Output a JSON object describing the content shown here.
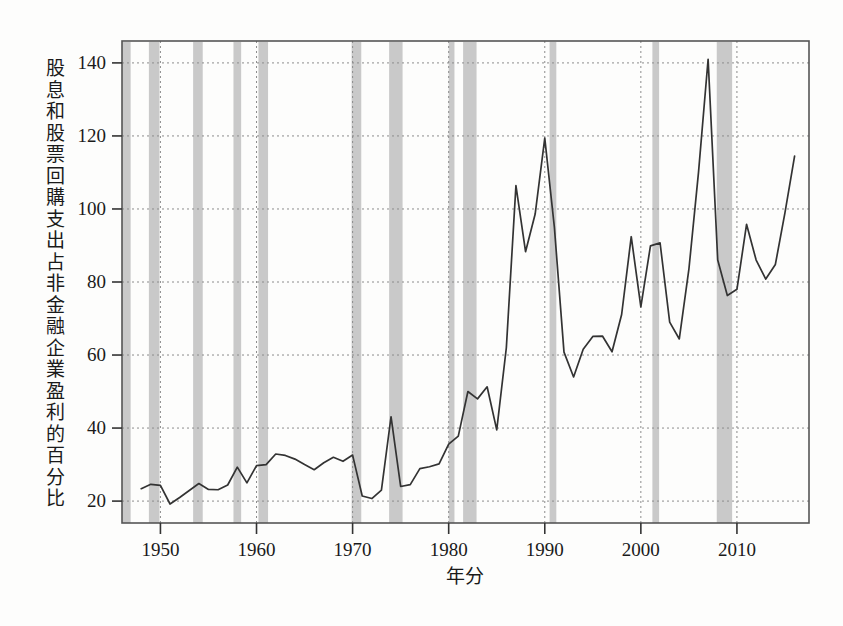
{
  "chart_data": {
    "type": "line",
    "title": "",
    "xlabel": "年分",
    "ylabel": "股息和股票回購支出占非金融企業盈利的百分比",
    "xlim": [
      1946,
      1917.5
    ],
    "x_axis_range": [
      1946.0,
      2017.5
    ],
    "ylim": [
      14,
      146
    ],
    "yticks": [
      20,
      40,
      60,
      80,
      100,
      120,
      140
    ],
    "ytick_labels": [
      "20",
      "40",
      "60",
      "80",
      "100",
      "120",
      "140"
    ],
    "xticks": [
      1950,
      1960,
      1970,
      1980,
      1990,
      2000,
      2010
    ],
    "xtick_labels": [
      "1950",
      "1960",
      "1970",
      "1980",
      "1990",
      "2000",
      "2010"
    ],
    "grid": true,
    "grid_style": "dotted",
    "legend": null,
    "line_color": "#333333",
    "band_color": "#bfbfbf",
    "series": [
      {
        "name": "股息和股票回購支出占非金融企業盈利的百分比",
        "x": [
          1948,
          1949,
          1950,
          1951,
          1952,
          1953,
          1954,
          1955,
          1956,
          1957,
          1958,
          1959,
          1960,
          1961,
          1962,
          1963,
          1964,
          1965,
          1966,
          1967,
          1968,
          1969,
          1970,
          1971,
          1972,
          1973,
          1974,
          1975,
          1976,
          1977,
          1978,
          1979,
          1980,
          1981,
          1982,
          1983,
          1984,
          1985,
          1986,
          1987,
          1988,
          1989,
          1990,
          1991,
          1992,
          1993,
          1994,
          1995,
          1996,
          1997,
          1998,
          1999,
          2000,
          2001,
          2002,
          2003,
          2004,
          2005,
          2006,
          2007,
          2008,
          2009,
          2010,
          2011,
          2012,
          2013,
          2014,
          2015,
          2016
        ],
        "values": [
          23.4,
          24.6,
          24.3,
          19.2,
          21.0,
          22.9,
          24.8,
          23.2,
          23.1,
          24.4,
          29.3,
          25.0,
          29.7,
          30.0,
          32.9,
          32.5,
          31.5,
          30.0,
          28.6,
          30.5,
          32.0,
          30.9,
          32.6,
          21.4,
          20.7,
          23.0,
          43.1,
          24.0,
          24.5,
          28.9,
          29.4,
          30.2,
          35.6,
          37.8,
          50.0,
          48.0,
          51.3,
          39.5,
          62.0,
          106.4,
          88.3,
          98.6,
          119.4,
          95.0,
          60.8,
          54.0,
          61.6,
          65.1,
          65.2,
          60.9,
          71.1,
          92.4,
          73.2,
          89.9,
          90.7,
          69.0,
          64.4,
          83.5,
          110.0,
          141.0,
          86.0,
          76.3,
          78.0,
          95.8,
          86.0,
          80.8,
          84.8,
          99.0,
          114.5
        ]
      }
    ],
    "recession_bands": [
      {
        "start": 1945.0,
        "end": 1946.9
      },
      {
        "start": 1948.8,
        "end": 1949.9
      },
      {
        "start": 1953.4,
        "end": 1954.4
      },
      {
        "start": 1957.6,
        "end": 1958.4
      },
      {
        "start": 1960.2,
        "end": 1961.2
      },
      {
        "start": 1969.9,
        "end": 1970.9
      },
      {
        "start": 1973.8,
        "end": 1975.2
      },
      {
        "start": 1980.0,
        "end": 1980.6
      },
      {
        "start": 1981.5,
        "end": 1982.9
      },
      {
        "start": 1990.5,
        "end": 1991.2
      },
      {
        "start": 2001.2,
        "end": 2001.9
      },
      {
        "start": 2007.9,
        "end": 2009.5
      }
    ]
  },
  "axis": {
    "ylabel": "股息和股票回購支出占非金融企業盈利的百分比",
    "xlabel": "年分"
  }
}
